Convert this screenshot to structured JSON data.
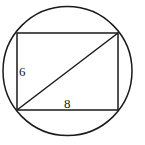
{
  "diagram": {
    "labels": {
      "height": "6",
      "width": "8"
    },
    "stroke_color": "#1a1a1a",
    "background": "#ffffff"
  }
}
